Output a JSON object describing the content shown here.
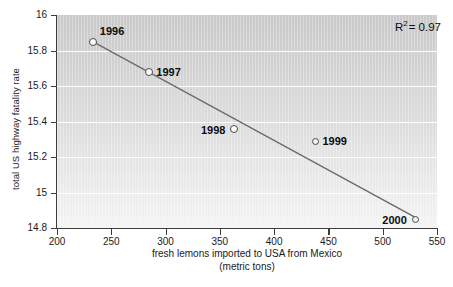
{
  "chart_data": {
    "type": "scatter",
    "title": "",
    "xlabel": "fresh lemons imported to USA from Mexico",
    "xlabel_line2": "(metric tons)",
    "ylabel": "total US highway fatality rate",
    "xlim": [
      200,
      550
    ],
    "ylim": [
      14.8,
      16.0
    ],
    "xticks": [
      "200",
      "250",
      "300",
      "350",
      "400",
      "450",
      "500",
      "550"
    ],
    "xtick_values": [
      200,
      250,
      300,
      350,
      400,
      450,
      500,
      550
    ],
    "yticks": [
      "14.8",
      "15",
      "15.2",
      "15.4",
      "15.6",
      "15.8",
      "16"
    ],
    "ytick_values": [
      14.8,
      15.0,
      15.2,
      15.4,
      15.6,
      15.8,
      16.0
    ],
    "grid": "horizontal-white",
    "legend": "none",
    "annotations": [
      {
        "name": "r-squared",
        "text_prefix": "R",
        "text_sup": "2",
        "text_suffix": "= 0.97",
        "value": 0.97
      }
    ],
    "series": [
      {
        "name": "lemon imports vs highway fatality rate",
        "point_labels": [
          "1996",
          "1997",
          "1998",
          "1999",
          "2000"
        ],
        "x": [
          233,
          285,
          363,
          438,
          530
        ],
        "y": [
          15.85,
          15.68,
          15.36,
          15.29,
          14.85
        ],
        "label_positions": [
          "above-right",
          "right",
          "left",
          "right",
          "left"
        ],
        "marker_styles": [
          "solid",
          "solid",
          "solid",
          "hollow",
          "hollow"
        ]
      }
    ],
    "trendline": {
      "name": "linear-fit",
      "x": [
        233,
        530
      ],
      "y": [
        15.85,
        14.86
      ],
      "color": "#6b6b6b"
    },
    "colors": {
      "plot_background_top": "#c9c9c9",
      "plot_background_bottom": "#f4f4f4",
      "gridline": "#ffffff",
      "axis": "#3c3c3c",
      "marker_face": "#fdfdfd",
      "marker_edge": "#4a4a4a",
      "trendline": "#6b6b6b",
      "text": "#0d0d0d"
    }
  }
}
